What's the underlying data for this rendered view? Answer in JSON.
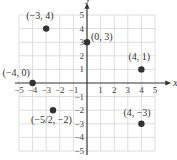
{
  "chart_data": {
    "type": "scatter",
    "title": "",
    "xlabel": "x",
    "ylabel": "y",
    "xlim": [
      -5,
      5
    ],
    "ylim": [
      -5,
      5
    ],
    "grid": true,
    "x_ticks": [
      "-5",
      "-4",
      "-3",
      "-2",
      "-1",
      "1",
      "2",
      "3",
      "4",
      "5"
    ],
    "y_ticks": [
      "5",
      "4",
      "3",
      "2",
      "1",
      "-1",
      "-2",
      "-3",
      "-4",
      "-5"
    ],
    "points": [
      {
        "x": -3,
        "y": 4,
        "label": "(−3, 4)"
      },
      {
        "x": 0,
        "y": 3,
        "label": "(0, 3)"
      },
      {
        "x": 4,
        "y": 1,
        "label": "(4, 1)"
      },
      {
        "x": -4,
        "y": 0,
        "label": "(−4, 0)"
      },
      {
        "x": -2.5,
        "y": -2,
        "label": "(−5/2, −2)"
      },
      {
        "x": 4,
        "y": -3,
        "label": "(4, −3)"
      }
    ],
    "colors": {
      "point": "#333333",
      "grid": "#dddddd",
      "axis": "#333333"
    }
  }
}
